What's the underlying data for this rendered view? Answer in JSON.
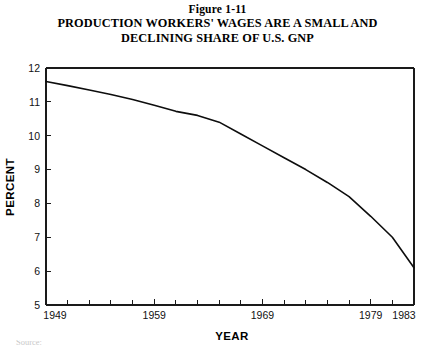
{
  "figure": {
    "number": "Figure 1-11",
    "title_line1": "PRODUCTION WORKERS' WAGES ARE A SMALL AND",
    "title_line2": "DECLINING SHARE OF U.S. GNP"
  },
  "source_note": "Source:",
  "colors": {
    "line": "#0d0d0d",
    "axis": "#1a1a1a",
    "background": "#ffffff"
  },
  "chart_data": {
    "type": "line",
    "title": "PRODUCTION WORKERS' WAGES ARE A SMALL AND DECLINING SHARE OF U.S. GNP",
    "subtitle": "Figure 1-11",
    "xlabel": "YEAR",
    "ylabel": "PERCENT",
    "xlim": [
      1949,
      1983
    ],
    "ylim": [
      5,
      12
    ],
    "grid": false,
    "legend": "none",
    "y_ticks": [
      5,
      6,
      7,
      8,
      9,
      10,
      11,
      12
    ],
    "y_tick_labels": [
      "5",
      "6",
      "7",
      "8",
      "9",
      "10",
      "11",
      "12"
    ],
    "x_ticks": [
      1949,
      1951,
      1953,
      1955,
      1957,
      1959,
      1961,
      1963,
      1965,
      1967,
      1969,
      1971,
      1973,
      1975,
      1977,
      1979,
      1981,
      1983
    ],
    "x_tick_labels": [
      "1949",
      "",
      "",
      "",
      "",
      "1959",
      "",
      "",
      "",
      "",
      "1969",
      "",
      "",
      "",
      "",
      "1979",
      "",
      "1983"
    ],
    "x_labeled_ticks": [
      1949,
      1959,
      1969,
      1979,
      1983
    ],
    "series": [
      {
        "name": "Production workers' wages as share of U.S. GNP",
        "x": [
          1949,
          1951,
          1953,
          1955,
          1957,
          1959,
          1961,
          1963,
          1965,
          1967,
          1969,
          1971,
          1973,
          1975,
          1977,
          1979,
          1981,
          1983
        ],
        "values": [
          11.6,
          11.48,
          11.35,
          11.22,
          11.07,
          10.9,
          10.72,
          10.6,
          10.4,
          10.05,
          9.7,
          9.35,
          9.0,
          8.62,
          8.2,
          7.62,
          7.0,
          6.1
        ]
      }
    ]
  }
}
